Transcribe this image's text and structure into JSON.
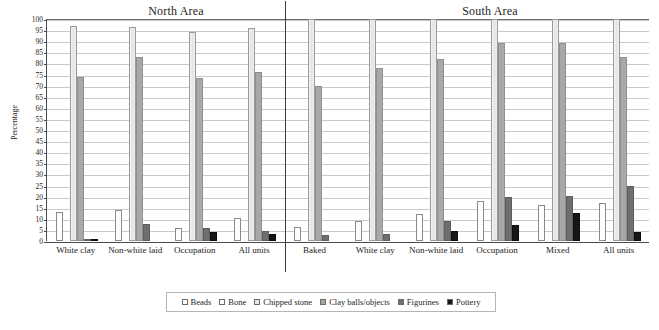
{
  "chart_data": {
    "type": "bar",
    "title": "",
    "xlabel": "",
    "ylabel": "Percentage",
    "ylim": [
      0,
      100
    ],
    "ytick_step": 5,
    "yticks": [
      0,
      5,
      10,
      15,
      20,
      25,
      30,
      35,
      40,
      45,
      50,
      55,
      60,
      65,
      70,
      75,
      80,
      85,
      90,
      95,
      100
    ],
    "grid": true,
    "legend_position": "bottom",
    "panels": [
      {
        "name": "North Area",
        "categories": [
          "White clay",
          "Non-white laid",
          "Occupation",
          "All units"
        ]
      },
      {
        "name": "South Area",
        "categories": [
          "Baked",
          "White clay",
          "Non-white laid",
          "Occupation",
          "Mixed",
          "All units"
        ]
      }
    ],
    "categories": [
      "White clay",
      "Non-white laid",
      "Occupation",
      "All units",
      "Baked",
      "White clay",
      "Non-white laid",
      "Occupation",
      "Mixed",
      "All units"
    ],
    "series": [
      {
        "name": "Beads",
        "color": "#ffffff",
        "values": [
          13,
          14,
          6,
          10.5,
          6.5,
          9,
          12,
          18,
          16,
          17
        ]
      },
      {
        "name": "Bone",
        "color": "#fbfbfb",
        "values": [
          0,
          0,
          0,
          0,
          0,
          0,
          0,
          0,
          0,
          0
        ]
      },
      {
        "name": "Chipped stone",
        "color": "#e6e6e6",
        "values": [
          97,
          96.5,
          94,
          96,
          100,
          100,
          100,
          100,
          100,
          100
        ]
      },
      {
        "name": "Clay balls/objects",
        "color": "#a8a8a8",
        "values": [
          74,
          83,
          73.5,
          76,
          70,
          78,
          82,
          89,
          89,
          83
        ]
      },
      {
        "name": "Figurines",
        "color": "#6e6e6e",
        "values": [
          1,
          7.5,
          6,
          4.5,
          2.5,
          3,
          9,
          20,
          20.5,
          25
        ]
      },
      {
        "name": "Pottery",
        "color": "#171717",
        "values": [
          1,
          0,
          4,
          3,
          0,
          0,
          4.5,
          7,
          12.5,
          4
        ]
      }
    ]
  },
  "legend": {
    "items": [
      {
        "label": "Beads"
      },
      {
        "label": "Bone"
      },
      {
        "label": "Chipped stone"
      },
      {
        "label": "Clay balls/objects"
      },
      {
        "label": "Figurines"
      },
      {
        "label": "Pottery"
      }
    ]
  }
}
